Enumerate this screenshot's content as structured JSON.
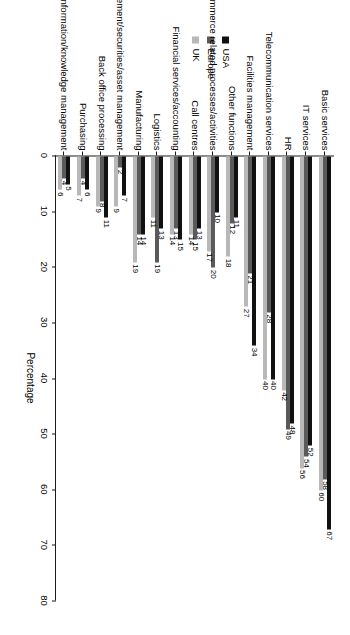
{
  "chart_data": {
    "type": "bar",
    "orientation": "horizontal",
    "title": "",
    "xlabel": "Percentage",
    "ylabel": "",
    "xlim": [
      0,
      80
    ],
    "xticks": [
      0,
      10,
      20,
      30,
      40,
      50,
      60,
      70,
      80
    ],
    "grid": false,
    "legend_position": "top",
    "categories": [
      "Basic services",
      "IT services",
      "HR",
      "Telecommunication services",
      "Facilities management",
      "Other functions",
      "E-commerce related processes/activities",
      "Call centres",
      "Financial services/accounting",
      "Logistics",
      "Manufacturing",
      "Fund management/securities/asset management",
      "Back office processing",
      "Purchasing",
      "Information/knowledge management"
    ],
    "series": [
      {
        "name": "USA",
        "color": "#111111",
        "values": [
          67,
          52,
          48,
          40,
          34,
          11,
          10,
          13,
          15,
          13,
          14,
          7,
          11,
          6,
          5
        ]
      },
      {
        "name": "Europe",
        "color": "#5a5a5a",
        "values": [
          58,
          54,
          49,
          28,
          21,
          12,
          20,
          15,
          13,
          19,
          14,
          2,
          8,
          4,
          4
        ]
      },
      {
        "name": "UK",
        "color": "#b8b8b8",
        "values": [
          60,
          56,
          42,
          40,
          27,
          18,
          17,
          14,
          14,
          11,
          19,
          9,
          9,
          7,
          6
        ]
      }
    ]
  },
  "legend": {
    "items": [
      {
        "label": "USA",
        "color": "#111111"
      },
      {
        "label": "Europe",
        "color": "#5a5a5a"
      },
      {
        "label": "UK",
        "color": "#b8b8b8"
      }
    ]
  },
  "axis": {
    "title": "Percentage",
    "tick_labels": [
      "0",
      "10",
      "20",
      "30",
      "40",
      "50",
      "60",
      "70",
      "80"
    ]
  }
}
